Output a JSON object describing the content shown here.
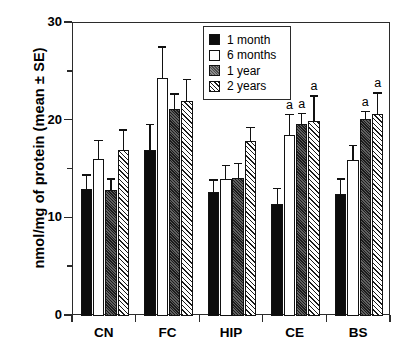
{
  "chart_data": {
    "type": "bar",
    "title": "",
    "xlabel": "",
    "ylabel": "nmol/mg of protein (mean ± SE)",
    "ylim": [
      0,
      30
    ],
    "yticks": [
      0,
      10,
      20,
      30
    ],
    "yticks_minor": [
      5,
      15,
      25
    ],
    "grid": false,
    "legend_position": "top-center",
    "categories": [
      "CN",
      "FC",
      "HIP",
      "CE",
      "BS"
    ],
    "series": [
      {
        "name": "1 month",
        "fill": "solid-black",
        "values": [
          13.0,
          17.0,
          12.7,
          11.5,
          12.5
        ],
        "errors": [
          1.5,
          2.7,
          1.3,
          1.6,
          1.6
        ],
        "annotations": [
          "",
          "",
          "",
          "",
          ""
        ]
      },
      {
        "name": "6 months",
        "fill": "white",
        "values": [
          16.1,
          24.4,
          14.0,
          18.5,
          16.0
        ],
        "errors": [
          1.9,
          3.2,
          1.5,
          2.2,
          1.5
        ],
        "annotations": [
          "",
          "",
          "",
          "a",
          ""
        ]
      },
      {
        "name": "1 year",
        "fill": "dark-hatch",
        "values": [
          12.9,
          21.2,
          14.1,
          19.7,
          20.2
        ],
        "errors": [
          1.2,
          1.6,
          1.6,
          1.1,
          0.8
        ],
        "annotations": [
          "",
          "",
          "",
          "a",
          "a"
        ]
      },
      {
        "name": "2 years",
        "fill": "diagonal-hatch",
        "values": [
          17.0,
          22.0,
          17.9,
          20.0,
          20.7
        ],
        "errors": [
          2.1,
          2.3,
          1.5,
          2.6,
          2.2
        ],
        "annotations": [
          "",
          "",
          "",
          "a",
          "a"
        ]
      }
    ]
  },
  "legend": {
    "items": [
      {
        "label": "1 month"
      },
      {
        "label": "6 months"
      },
      {
        "label": "1 year"
      },
      {
        "label": "2 years"
      }
    ]
  },
  "axes": {
    "y_title": "nmol/mg of protein (mean ± SE)",
    "y_tick_labels": [
      "0",
      "10",
      "20",
      "30"
    ],
    "x_tick_labels": [
      "CN",
      "FC",
      "HIP",
      "CE",
      "BS"
    ]
  },
  "colors": {
    "axis": "#2b2b2b",
    "series_1_month": "#0c0c0c",
    "series_6_months": "#ffffff",
    "series_1_year": "#1c1c1c",
    "series_2_years": "#ffffff",
    "text": "#000000"
  }
}
